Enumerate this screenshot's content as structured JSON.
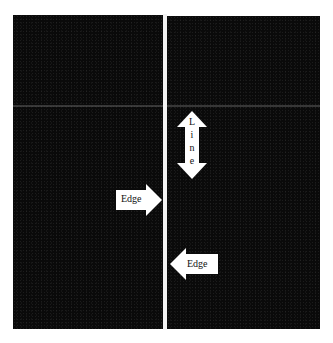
{
  "image": {
    "background_color": "#0a0a0a",
    "line_color": "#f2f2f2",
    "annotations": [
      {
        "id": "line-arrow",
        "type": "double-vertical-arrow",
        "label": "Line",
        "label_chars": [
          "L",
          "i",
          "n",
          "e"
        ]
      },
      {
        "id": "edge-arrow-right",
        "type": "right-arrow",
        "label": "Edge"
      },
      {
        "id": "edge-arrow-left",
        "type": "left-arrow",
        "label": "Edge"
      }
    ]
  }
}
